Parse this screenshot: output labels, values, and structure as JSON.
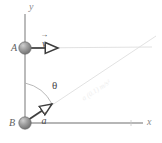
{
  "figure": {
    "type": "physics-vector-diagram",
    "background_color": "#ffffff"
  },
  "axes": {
    "x_label": "x",
    "y_label": "y",
    "axis_color": "#9a9a9a",
    "origin_label": "B"
  },
  "points": [
    {
      "id": "A",
      "label": "A",
      "x": 25,
      "y": 48,
      "fill": "#8d8d8d"
    },
    {
      "id": "B",
      "label": "B",
      "x": 25,
      "y": 123,
      "fill": "#8d8d8d"
    }
  ],
  "vectors": [
    {
      "id": "v",
      "label": "v",
      "from_point": "A",
      "direction": "right",
      "arrow_style": "open",
      "color": "#3b3b3b"
    },
    {
      "id": "a",
      "label": "a",
      "from_point": "B",
      "direction": "up-right",
      "arrow_style": "open",
      "color": "#3b3b3b"
    }
  ],
  "angle": {
    "label": "θ",
    "from": "y-axis",
    "to": "diagonal-line",
    "arc_color": "#a8a8a8"
  },
  "guide_lines": {
    "diagonal_label": "a (0.1) m/s²",
    "diagonal_color": "#dcdcdc",
    "horizontal_color": "#d8d8d8"
  }
}
